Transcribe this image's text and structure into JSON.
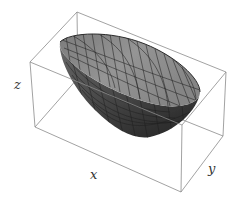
{
  "figure": {
    "type": "3d-surface",
    "colors": {
      "box": "#8a8a8a",
      "surface_fill": "#7a7a7a",
      "surface_light": "#9a9a9a",
      "surface_dark": "#3c3c3c",
      "mesh": "#1e1e1e",
      "label": "#333333"
    },
    "axes": {
      "x_label": "x",
      "y_label": "y",
      "z_label": "z"
    }
  }
}
